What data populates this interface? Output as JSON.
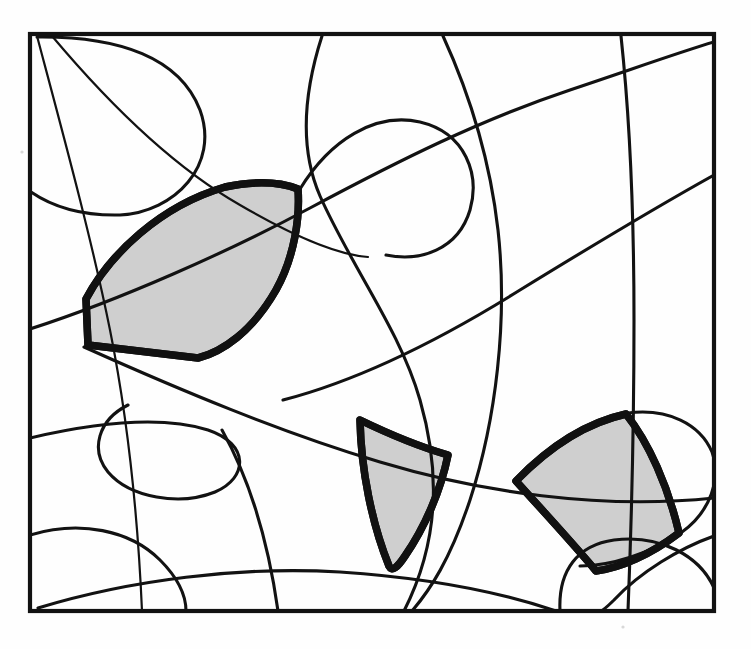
{
  "figure": {
    "title": "Arrangement of curves in a square with three shaded faces",
    "kind": "line-arrangement-diagram",
    "background_color": "#fefefe",
    "ink_color": "#121212",
    "shade_color": "#cfcfcf",
    "shade_outline_color": "#111111",
    "frame": {
      "name": "bounding-square",
      "x1": 30,
      "y1": 34,
      "x2": 714,
      "y2": 611,
      "stroke_width": 4.2
    },
    "counts": {
      "shaded_faces": 3,
      "curves": 12
    },
    "shaded_faces": [
      {
        "id": "face-upper-left",
        "label": "upper-left shaded cell",
        "fill": "#cfcfcf",
        "path": "M 88 345 L 86 299 C 110 254 160 206 225 187 C 258 180 280 182 298 189 C 300 216 295 256 276 290 C 252 332 222 352 198 358 Z"
      },
      {
        "id": "face-center-bottom",
        "label": "center-bottom shaded triangle cell",
        "fill": "#cfcfcf",
        "path": "M 360 420 C 393 436 424 448 448 455 C 441 490 425 527 405 556 C 397 568 392 572 389 566 C 372 524 361 470 360 420 Z"
      },
      {
        "id": "face-lower-right",
        "label": "lower-right shaded cell",
        "fill": "#cfcfcf",
        "path": "M 516 481 C 548 448 585 423 626 414 C 649 443 668 486 679 533 C 650 555 620 568 596 571 C 570 540 541 509 516 481 Z"
      }
    ],
    "curves": [
      {
        "id": "curve-1",
        "label": "left vertical S-curve",
        "d": "M 37 36 C 62 130 92 240 110 330 C 128 420 138 520 142 611"
      },
      {
        "id": "curve-2",
        "label": "upper-left lobe arc",
        "d": "M 37 37 C 120 36 180 58 200 110 C 220 165 175 212 120 215 C 78 216 50 205 31 192"
      },
      {
        "id": "curve-3",
        "label": "upper-left diagonal to mid",
        "d": "M 52 36 C 110 105 175 168 240 205 C 300 240 340 255 368 257"
      },
      {
        "id": "curve-4",
        "label": "long top-left to right sweep",
        "d": "M 30 329 C 120 300 230 251 310 208 C 400 160 480 120 570 90 C 630 70 680 52 714 42"
      },
      {
        "id": "curve-5",
        "label": "central tall vertical arc",
        "d": "M 322 36 C 303 95 300 150 320 196 C 352 268 400 330 420 400 C 440 470 440 540 404 611"
      },
      {
        "id": "curve-6",
        "label": "upper-middle hook",
        "d": "M 300 189 C 330 140 375 112 420 122 C 466 133 480 175 470 210 C 458 250 420 262 386 255"
      },
      {
        "id": "curve-7",
        "label": "right tall arc from top",
        "d": "M 443 36 C 470 95 490 160 498 230 C 508 320 496 420 470 500 C 450 560 430 590 412 611"
      },
      {
        "id": "curve-8",
        "label": "right-of-center steep arc",
        "d": "M 621 36 C 630 120 634 220 634 320 C 634 420 632 510 628 611"
      },
      {
        "id": "curve-9",
        "label": "mid-right rising sweep",
        "d": "M 283 400 C 360 380 440 340 520 290 C 590 247 660 205 714 175"
      },
      {
        "id": "curve-10",
        "label": "long low sweep to right edge",
        "d": "M 84 347 C 180 390 280 432 380 462 C 480 492 600 510 714 498"
      },
      {
        "id": "curve-11",
        "label": "lower-left loop",
        "d": "M 30 438 C 90 424 160 415 208 430 C 250 444 248 478 215 492 C 180 506 130 498 108 472 C 90 450 98 420 128 405"
      },
      {
        "id": "curve-12",
        "label": "bottom sweeping arc",
        "d": "M 222 430 C 250 480 268 540 278 611"
      },
      {
        "id": "curve-13",
        "label": "bottom-left small hump",
        "d": "M 30 535 C 80 520 130 530 160 560 C 180 580 186 598 186 611"
      },
      {
        "id": "curve-14",
        "label": "bottom wide arc",
        "d": "M 38 608 C 130 580 240 566 340 572 C 430 578 500 592 556 611"
      },
      {
        "id": "curve-15",
        "label": "lower-right rounded lobe",
        "d": "M 560 611 C 558 570 578 545 614 540 C 660 534 700 556 714 588"
      },
      {
        "id": "curve-16",
        "label": "right lobe arc",
        "d": "M 628 413 C 668 408 700 424 712 452 C 722 478 710 512 682 532 C 650 554 610 566 580 566"
      },
      {
        "id": "curve-17",
        "label": "bottom-right tail",
        "d": "M 714 536 C 680 548 640 572 614 600 C 606 608 602 611 600 611"
      }
    ],
    "specks": [
      {
        "x": 22,
        "y": 152
      },
      {
        "x": 623,
        "y": 627
      }
    ]
  }
}
